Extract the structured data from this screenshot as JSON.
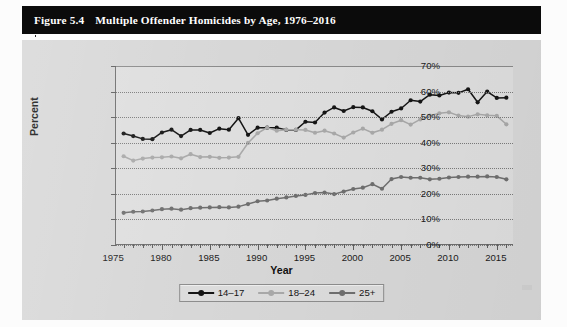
{
  "figure": {
    "number_label": "Figure 5.4",
    "title": "Multiple Offender Homicides by Age, 1976–2016"
  },
  "axes": {
    "y_title": "Percent",
    "x_title": "Year",
    "y_ticklabels": [
      "70%",
      "60%",
      "50%",
      "40%",
      "30%",
      "20%",
      "10%",
      "0%"
    ],
    "x_ticklabels": [
      "1975",
      "1980",
      "1985",
      "1990",
      "1995",
      "2000",
      "2005",
      "2010",
      "2015"
    ]
  },
  "legend": {
    "items": [
      {
        "label": "14–17",
        "color": "#151515"
      },
      {
        "label": "18–24",
        "color": "#a9a9a9"
      },
      {
        "label": "25+",
        "color": "#6f6f6f"
      }
    ]
  },
  "colors": {
    "panel_background": "#d7d7d7",
    "plot_background": "#dedede",
    "axis": "#6e6e6e",
    "gridline": "#7b7b7b",
    "banner": "#0b0b0b",
    "banner_text": "#ffffff"
  },
  "chart_data": {
    "type": "line",
    "title": "Multiple Offender Homicides by Age, 1976–2016",
    "xlabel": "Year",
    "ylabel": "Percent",
    "xlim": [
      1975.2,
      2016.8
    ],
    "ylim": [
      0,
      70
    ],
    "y_unit": "percent",
    "grid": true,
    "legend_position": "bottom",
    "x": [
      1976,
      1977,
      1978,
      1979,
      1980,
      1981,
      1982,
      1983,
      1984,
      1985,
      1986,
      1987,
      1988,
      1989,
      1990,
      1991,
      1992,
      1993,
      1994,
      1995,
      1996,
      1997,
      1998,
      1999,
      2000,
      2001,
      2002,
      2003,
      2004,
      2005,
      2006,
      2007,
      2008,
      2009,
      2010,
      2011,
      2012,
      2013,
      2014,
      2015,
      2016
    ],
    "series": [
      {
        "name": "14–17",
        "color": "#151515",
        "marker": "circle",
        "values": [
          43.6,
          42.6,
          41.5,
          41.4,
          44.0,
          45.1,
          42.6,
          45.0,
          45.0,
          43.8,
          45.5,
          45.1,
          49.6,
          43.1,
          45.9,
          45.9,
          45.9,
          45.0,
          45.0,
          48.2,
          47.9,
          51.8,
          53.8,
          52.4,
          53.9,
          53.8,
          52.3,
          49.1,
          52.1,
          53.4,
          56.6,
          56.1,
          58.8,
          58.5,
          59.6,
          59.5,
          60.9,
          55.8,
          60.0,
          57.5,
          57.6
        ]
      },
      {
        "name": "18–24",
        "color": "#a9a9a9",
        "marker": "circle",
        "values": [
          34.7,
          33.0,
          33.8,
          34.2,
          34.3,
          34.6,
          33.9,
          35.5,
          34.4,
          34.5,
          34.1,
          34.2,
          34.5,
          39.9,
          43.7,
          45.9,
          44.7,
          45.1,
          45.1,
          45.0,
          43.9,
          44.7,
          43.6,
          42.0,
          44.0,
          45.5,
          43.9,
          45.1,
          47.4,
          48.8,
          47.1,
          49.1,
          50.6,
          51.5,
          51.9,
          50.6,
          50.2,
          51.1,
          50.7,
          50.5,
          47.2
        ]
      },
      {
        "name": "25+",
        "color": "#6f6f6f",
        "marker": "circle",
        "values": [
          12.6,
          13.0,
          13.1,
          13.5,
          14.0,
          14.2,
          13.8,
          14.4,
          14.6,
          14.7,
          14.8,
          14.7,
          15.0,
          16.0,
          17.1,
          17.4,
          18.1,
          18.6,
          19.2,
          19.6,
          20.3,
          20.5,
          19.9,
          20.9,
          21.9,
          22.4,
          23.8,
          22.0,
          25.8,
          26.6,
          26.3,
          26.3,
          25.7,
          25.9,
          26.4,
          26.6,
          26.7,
          26.7,
          26.8,
          26.6,
          25.7
        ]
      }
    ]
  }
}
